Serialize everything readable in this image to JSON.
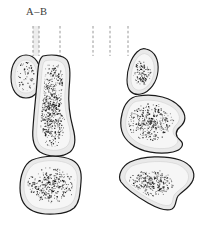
{
  "figure": {
    "type": "scientific-illustration",
    "background_color": "#ffffff",
    "label": {
      "text": "A–B",
      "color": "#3a3a3a"
    },
    "colors": {
      "outline": "#1a1a1a",
      "halo_fill": "#e9e9e9",
      "inner_fill": "#f4f4f4",
      "stipple": "#111111",
      "dash_line": "#8c8c8c"
    },
    "guide_lines": {
      "name": "dashed-reference-lines",
      "style": "dashed vertical",
      "left_group_x": [
        33,
        39,
        60
      ],
      "right_group_x": [
        93,
        110,
        128
      ],
      "y_top": 26,
      "y_bottom": 56,
      "shaded_band": {
        "x": 33,
        "width": 6,
        "color": "#ededed"
      }
    },
    "shapes": [
      {
        "name": "small-oval-upper-left",
        "group": "left-column",
        "cx": 26,
        "cy": 76,
        "rx": 14,
        "ry": 21,
        "stipple_count": 70
      },
      {
        "name": "elongated-bone-left",
        "group": "left-column",
        "cx": 54,
        "cy": 110,
        "stipple_count": 620
      },
      {
        "name": "rounded-quadrilateral-lower-left",
        "group": "left-column",
        "cx": 53,
        "cy": 186,
        "stipple_count": 330
      },
      {
        "name": "teardrop-oval-upper-right",
        "group": "right-column",
        "cx": 143,
        "cy": 72,
        "stipple_count": 110
      },
      {
        "name": "kidney-shape-middle-right",
        "group": "right-column",
        "cx": 152,
        "cy": 120,
        "stipple_count": 360
      },
      {
        "name": "wedge-shape-lower-right",
        "group": "right-column",
        "cx": 152,
        "cy": 186,
        "stipple_count": 300
      }
    ]
  }
}
